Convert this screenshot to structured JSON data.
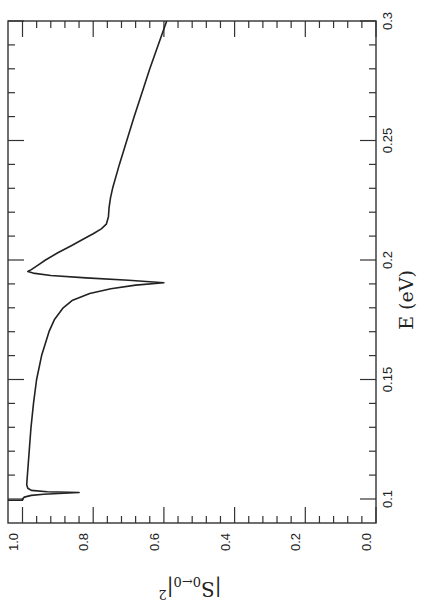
{
  "chart_data": {
    "type": "line",
    "orientation": "rotated 90deg clockwise (energy axis vertical, increasing upward; |S|^2 axis horizontal, increasing leftward)",
    "title": "",
    "xlabel": "E (eV)",
    "ylabel": "|S_{0←0}|^2",
    "ylabel_parts": {
      "base": "|S",
      "sub": "0←0",
      "close": "|",
      "sup": "2"
    },
    "xlim": [
      0.0995,
      0.3
    ],
    "ylim": [
      0.0,
      1.04
    ],
    "x_ticks": [
      0.1,
      0.15,
      0.2,
      0.25,
      0.3
    ],
    "x_tick_labels": [
      "0.1",
      "0.15",
      "0.2",
      "0.25",
      "0.3"
    ],
    "y_ticks": [
      0.0,
      0.2,
      0.4,
      0.6,
      0.8,
      1.0
    ],
    "y_tick_labels": [
      "0.0",
      "0.2",
      "0.4",
      "0.6",
      "0.8",
      "1.0"
    ],
    "grid": false,
    "legend": null,
    "series": [
      {
        "name": "|S_{0←0}|^2",
        "color": "#222222",
        "x": [
          0.0995,
          0.1,
          0.1008,
          0.1015,
          0.102,
          0.1025,
          0.1027,
          0.103,
          0.1036,
          0.1045,
          0.106,
          0.11,
          0.12,
          0.13,
          0.14,
          0.15,
          0.16,
          0.17,
          0.175,
          0.18,
          0.183,
          0.186,
          0.188,
          0.1895,
          0.1905,
          0.1915,
          0.1925,
          0.1935,
          0.1945,
          0.1952,
          0.196,
          0.198,
          0.2,
          0.203,
          0.206,
          0.209,
          0.211,
          0.213,
          0.215,
          0.218,
          0.222,
          0.226,
          0.23,
          0.24,
          0.25,
          0.26,
          0.27,
          0.28,
          0.29,
          0.3
        ],
        "y": [
          1.0,
          1.0,
          0.995,
          0.975,
          0.94,
          0.87,
          0.84,
          0.93,
          0.975,
          0.985,
          0.988,
          0.986,
          0.981,
          0.976,
          0.969,
          0.96,
          0.946,
          0.925,
          0.91,
          0.885,
          0.86,
          0.81,
          0.75,
          0.68,
          0.6,
          0.7,
          0.82,
          0.92,
          0.97,
          0.985,
          0.975,
          0.955,
          0.935,
          0.9,
          0.862,
          0.825,
          0.8,
          0.777,
          0.763,
          0.757,
          0.755,
          0.751,
          0.745,
          0.726,
          0.705,
          0.684,
          0.662,
          0.64,
          0.616,
          0.592
        ]
      }
    ],
    "annotations": [
      {
        "text": "sharp resonance dip near E≈0.103 eV to ≈0.84"
      },
      {
        "text": "resonance dip near E≈0.19 eV to ≈0.60, followed by peak ≈0.985 at E≈0.195 eV"
      }
    ]
  }
}
